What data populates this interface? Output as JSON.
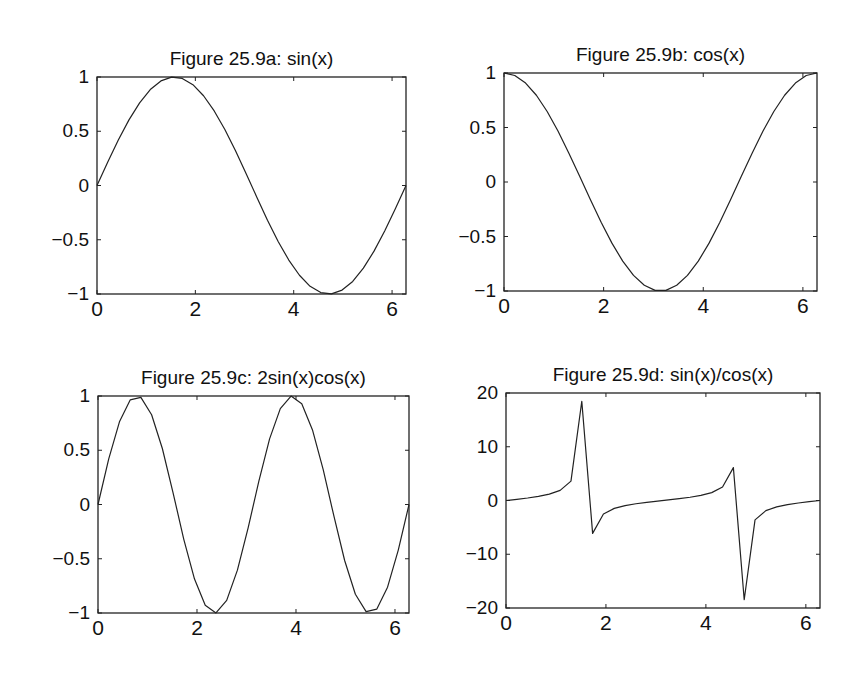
{
  "chart_data": [
    {
      "type": "line",
      "title": "Figure 25.9a: sin(x)",
      "function": "sin(x)",
      "xlabel": "",
      "ylabel": "",
      "xlim": [
        0,
        6.2832
      ],
      "ylim": [
        -1,
        1
      ],
      "xticks": [
        0,
        2,
        4,
        6
      ],
      "xtick_labels": [
        "0",
        "2",
        "4",
        "6"
      ],
      "yticks": [
        -1,
        -0.5,
        0,
        0.5,
        1
      ],
      "ytick_labels": [
        "−1",
        "−0.5",
        "0",
        "0.5",
        "1"
      ],
      "grid": false,
      "legend": null,
      "x": [
        0,
        0.2167,
        0.4333,
        0.65,
        0.8666,
        1.0833,
        1.3,
        1.5166,
        1.7333,
        1.95,
        2.1666,
        2.3833,
        2.5999,
        2.8166,
        3.0333,
        3.2499,
        3.4666,
        3.6832,
        3.8999,
        4.1166,
        4.3332,
        4.5499,
        4.7666,
        4.9832,
        5.1999,
        5.4165,
        5.6332,
        5.8499,
        6.0665,
        6.2832
      ],
      "values": [
        0,
        0.215,
        0.42,
        0.605,
        0.762,
        0.884,
        0.964,
        0.999,
        0.987,
        0.929,
        0.827,
        0.687,
        0.516,
        0.321,
        0.108,
        -0.108,
        -0.321,
        -0.516,
        -0.687,
        -0.827,
        -0.929,
        -0.987,
        -0.999,
        -0.964,
        -0.884,
        -0.762,
        -0.605,
        -0.42,
        -0.215,
        0
      ]
    },
    {
      "type": "line",
      "title": "Figure 25.9b: cos(x)",
      "function": "cos(x)",
      "xlabel": "",
      "ylabel": "",
      "xlim": [
        0,
        6.2832
      ],
      "ylim": [
        -1,
        1
      ],
      "xticks": [
        0,
        2,
        4,
        6
      ],
      "xtick_labels": [
        "0",
        "2",
        "4",
        "6"
      ],
      "yticks": [
        -1,
        -0.5,
        0,
        0.5,
        1
      ],
      "ytick_labels": [
        "−1",
        "−0.5",
        "0",
        "0.5",
        "1"
      ],
      "grid": false,
      "legend": null,
      "x": [
        0,
        0.2167,
        0.4333,
        0.65,
        0.8666,
        1.0833,
        1.3,
        1.5166,
        1.7333,
        1.95,
        2.1666,
        2.3833,
        2.5999,
        2.8166,
        3.0333,
        3.2499,
        3.4666,
        3.6832,
        3.8999,
        4.1166,
        4.3332,
        4.5499,
        4.7666,
        4.9832,
        5.1999,
        5.4165,
        5.6332,
        5.8499,
        6.0665,
        6.2832
      ],
      "values": [
        1,
        0.977,
        0.908,
        0.796,
        0.647,
        0.468,
        0.267,
        0.054,
        -0.161,
        -0.37,
        -0.561,
        -0.726,
        -0.857,
        -0.947,
        -0.994,
        -0.994,
        -0.947,
        -0.857,
        -0.726,
        -0.561,
        -0.37,
        -0.161,
        0.054,
        0.267,
        0.468,
        0.647,
        0.796,
        0.908,
        0.977,
        1
      ]
    },
    {
      "type": "line",
      "title": "Figure 25.9c: 2sin(x)cos(x)",
      "function": "2sin(x)cos(x)",
      "xlabel": "",
      "ylabel": "",
      "xlim": [
        0,
        6.2832
      ],
      "ylim": [
        -1,
        1
      ],
      "xticks": [
        0,
        2,
        4,
        6
      ],
      "xtick_labels": [
        "0",
        "2",
        "4",
        "6"
      ],
      "yticks": [
        -1,
        -0.5,
        0,
        0.5,
        1
      ],
      "ytick_labels": [
        "−1",
        "−0.5",
        "0",
        "0.5",
        "1"
      ],
      "grid": false,
      "legend": null,
      "x": [
        0,
        0.2167,
        0.4333,
        0.65,
        0.8666,
        1.0833,
        1.3,
        1.5166,
        1.7333,
        1.95,
        2.1666,
        2.3833,
        2.5999,
        2.8166,
        3.0333,
        3.2499,
        3.4666,
        3.6832,
        3.8999,
        4.1166,
        4.3332,
        4.5499,
        4.7666,
        4.9832,
        5.1999,
        5.4165,
        5.6332,
        5.8499,
        6.0665,
        6.2832
      ],
      "values": [
        0,
        0.42,
        0.762,
        0.964,
        0.987,
        0.827,
        0.516,
        0.108,
        -0.321,
        -0.687,
        -0.929,
        -0.999,
        -0.884,
        -0.605,
        -0.215,
        0.215,
        0.605,
        0.884,
        0.999,
        0.929,
        0.687,
        0.321,
        -0.108,
        -0.516,
        -0.827,
        -0.987,
        -0.964,
        -0.762,
        -0.42,
        0
      ]
    },
    {
      "type": "line",
      "title": "Figure 25.9d: sin(x)/cos(x)",
      "function": "sin(x)/cos(x)",
      "xlabel": "",
      "ylabel": "",
      "xlim": [
        0,
        6.2832
      ],
      "ylim": [
        -20,
        20
      ],
      "xticks": [
        0,
        2,
        4,
        6
      ],
      "xtick_labels": [
        "0",
        "2",
        "4",
        "6"
      ],
      "yticks": [
        -20,
        -10,
        0,
        10,
        20
      ],
      "ytick_labels": [
        "−20",
        "−10",
        "0",
        "10",
        "20"
      ],
      "grid": false,
      "legend": null,
      "x": [
        0,
        0.2167,
        0.4333,
        0.65,
        0.8666,
        1.0833,
        1.3,
        1.5166,
        1.7333,
        1.95,
        2.1666,
        2.3833,
        2.5999,
        2.8166,
        3.0333,
        3.2499,
        3.4666,
        3.6832,
        3.8999,
        4.1166,
        4.3332,
        4.5499,
        4.7666,
        4.9832,
        5.1999,
        5.4165,
        5.6332,
        5.8499,
        6.0665,
        6.2832
      ],
      "values": [
        0,
        0.22,
        0.462,
        0.76,
        1.178,
        1.89,
        3.602,
        18.46,
        -6.12,
        -2.51,
        -1.47,
        -0.947,
        -0.602,
        -0.339,
        -0.109,
        0.109,
        0.339,
        0.602,
        0.947,
        1.47,
        2.51,
        6.12,
        -18.46,
        -3.602,
        -1.89,
        -1.178,
        -0.76,
        -0.462,
        -0.22,
        0
      ]
    }
  ],
  "layout": {
    "panels": [
      {
        "left": 97,
        "top": 77,
        "width": 309,
        "height": 217
      },
      {
        "left": 504,
        "top": 73,
        "width": 313,
        "height": 218
      },
      {
        "left": 98,
        "top": 396,
        "width": 311,
        "height": 217
      },
      {
        "left": 506,
        "top": 393,
        "width": 314,
        "height": 215
      }
    ]
  },
  "style": {
    "line_color": "#222222",
    "axis_color": "#222222",
    "background": "#ffffff"
  }
}
